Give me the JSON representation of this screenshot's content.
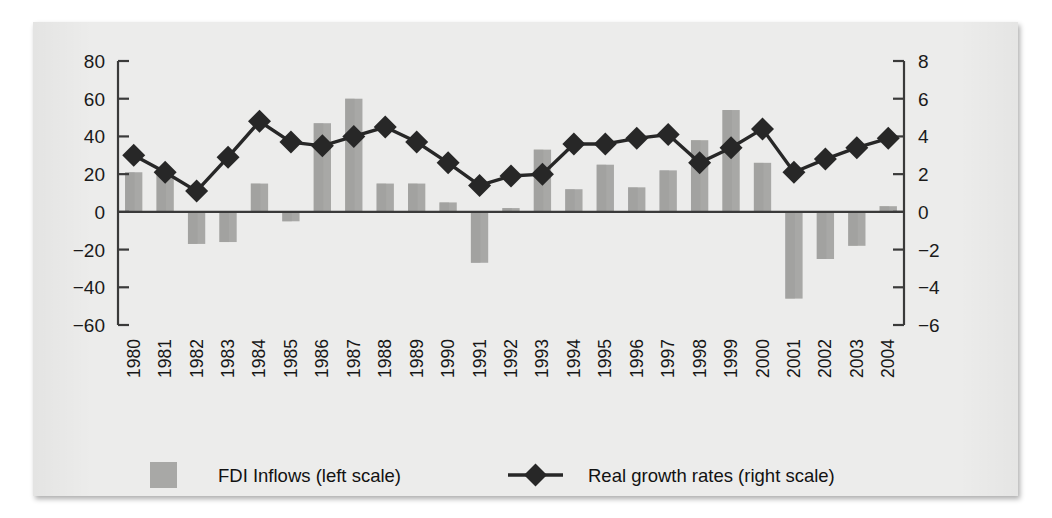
{
  "chart_data": {
    "type": "bar",
    "title": "",
    "subtitle": "",
    "xlabel": "",
    "ylabel": "",
    "grid": false,
    "legend_position": "bottom",
    "categories": [
      "1980",
      "1981",
      "1982",
      "1983",
      "1984",
      "1985",
      "1986",
      "1987",
      "1988",
      "1989",
      "1990",
      "1991",
      "1992",
      "1993",
      "1994",
      "1995",
      "1996",
      "1997",
      "1998",
      "1999",
      "2000",
      "2001",
      "2002",
      "2003",
      "2004"
    ],
    "axes": {
      "left": {
        "label": "",
        "ticks": [
          80,
          60,
          40,
          20,
          0,
          -20,
          -40,
          -60
        ],
        "tick_labels": [
          "80",
          "60",
          "40",
          "20",
          "0",
          "−20",
          "−40",
          "−60"
        ],
        "ylim": [
          -60,
          80
        ],
        "series_name": "FDI Inflows (left scale)"
      },
      "right": {
        "label": "",
        "ticks": [
          8,
          6,
          4,
          2,
          0,
          -2,
          -4,
          -6
        ],
        "tick_labels": [
          "8",
          "6",
          "4",
          "2",
          "0",
          "−2",
          "−4",
          "−6"
        ],
        "ylim": [
          -6,
          8
        ],
        "series_name": "Real growth rates (right scale)"
      }
    },
    "series": [
      {
        "name": "FDI Inflows (left scale)",
        "type": "bar",
        "axis": "left",
        "color": "#a8a8a6",
        "values": [
          21,
          22,
          -17,
          -16,
          15,
          -5,
          47,
          60,
          15,
          15,
          5,
          -27,
          2,
          33,
          12,
          25,
          13,
          22,
          38,
          54,
          26,
          -46,
          -25,
          -18,
          3
        ]
      },
      {
        "name": "Real growth rates (right scale)",
        "type": "line",
        "axis": "right",
        "color": "#272727",
        "marker": "diamond",
        "values": [
          3.0,
          2.1,
          1.1,
          2.9,
          4.8,
          3.7,
          3.5,
          4.0,
          4.5,
          3.7,
          2.6,
          1.4,
          1.9,
          2.0,
          3.6,
          3.6,
          3.9,
          4.1,
          2.6,
          3.4,
          4.4,
          2.1,
          2.8,
          3.4,
          3.9
        ]
      }
    ]
  },
  "legend": {
    "items": [
      {
        "label": "FDI Inflows (left scale)",
        "marker": "square",
        "color": "#a8a8a6"
      },
      {
        "label": "Real growth rates (right scale)",
        "marker": "diamond-line",
        "color": "#272727"
      }
    ]
  },
  "colors": {
    "background": "#ffffff",
    "panel": "#ececeb",
    "bar": "#a8a8a6",
    "line": "#272727",
    "axis": "#3a3a3a",
    "text": "#171717"
  }
}
